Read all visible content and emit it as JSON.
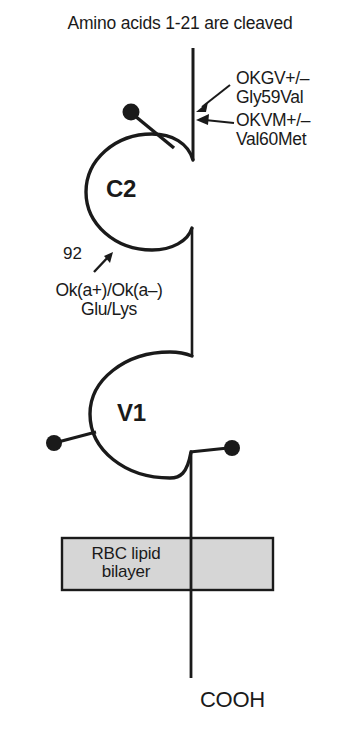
{
  "figure": {
    "title": "Amino acids 1-21 are cleaved",
    "background_color": "#ffffff",
    "stroke_color": "#1a1a1a"
  },
  "annotations": {
    "okgv": "OKGV+/–\nGly59Val",
    "okvm": "OKVM+/–\nVal60Met",
    "okgv_allele": "OKGV+/–",
    "okgv_mutation": "Gly59Val",
    "okvm_allele": "OKVM+/–",
    "okvm_mutation": "Val60Met",
    "residue_number": "92",
    "oka_polymorphism": "Ok(a+)/Ok(a–)\nGlu/Lys",
    "oka_allele": "Ok(a+)/Ok(a–)",
    "oka_residues": "Glu/Lys"
  },
  "domains": {
    "c2_label": "C2",
    "v1_label": "V1"
  },
  "membrane": {
    "label": "RBC lipid\nbilayer",
    "line1": "RBC lipid",
    "line2": "bilayer",
    "fill_color": "#d6d6d6",
    "border_color": "#1a1a1a"
  },
  "terminus": {
    "c_terminus": "COOH"
  },
  "glycosylation_sites": [
    {
      "name": "c2-glycan",
      "x": 132,
      "y": 112
    },
    {
      "name": "v1-glycan-left",
      "x": 54,
      "y": 442
    },
    {
      "name": "v1-glycan-right",
      "x": 232,
      "y": 448
    }
  ]
}
